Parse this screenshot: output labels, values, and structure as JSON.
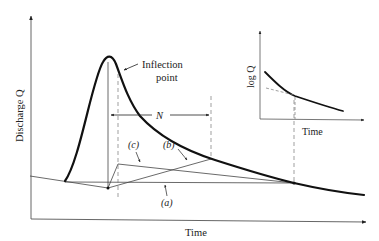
{
  "diagram": {
    "type": "hydrograph-baseflow-separation",
    "main_axes": {
      "y_label": "Discharge Q",
      "x_label": "Time"
    },
    "annotations": {
      "inflection_label_line1": "Inflection",
      "inflection_label_line2": "point",
      "interval_label": "N",
      "method_a": "(a)",
      "method_b": "(b)",
      "method_c": "(c)"
    },
    "inset": {
      "y_label": "log Q",
      "x_label": "Time"
    },
    "colors": {
      "ink": "#1a1a1a",
      "thin_line": "#444444",
      "dashed": "#777777",
      "background": "#ffffff"
    }
  }
}
